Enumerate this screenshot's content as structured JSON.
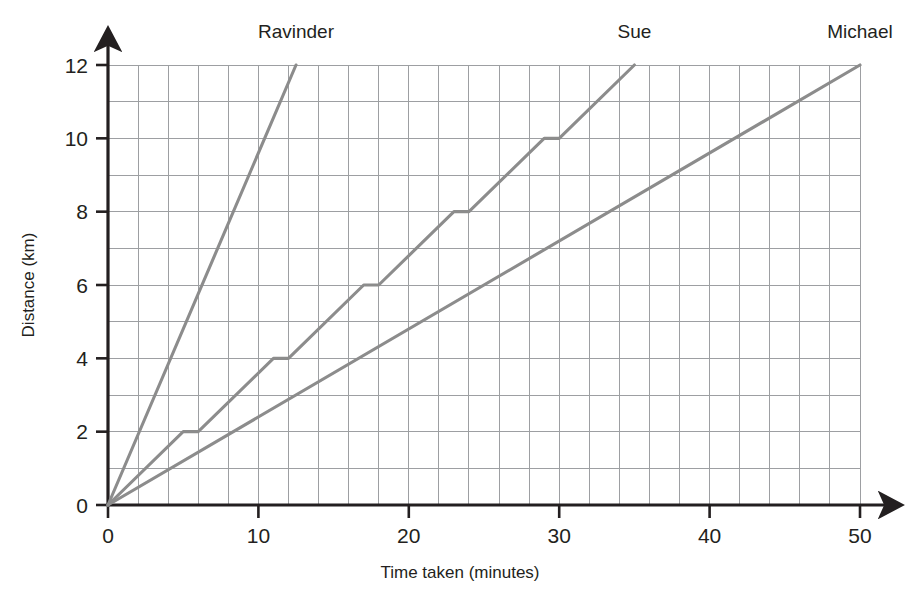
{
  "chart_data": {
    "type": "line",
    "title": "",
    "xlabel": "Time taken (minutes)",
    "ylabel": "Distance (km)",
    "xlim": [
      0,
      50
    ],
    "ylim": [
      0,
      12
    ],
    "xticks": [
      0,
      10,
      20,
      30,
      40,
      50
    ],
    "yticks": [
      0,
      2,
      4,
      6,
      8,
      10,
      12
    ],
    "xtick_labels": [
      "0",
      "10",
      "20",
      "30",
      "40",
      "50"
    ],
    "ytick_labels": [
      "0",
      "2",
      "4",
      "6",
      "8",
      "10",
      "12"
    ],
    "x_minor_step": 2,
    "y_minor_step": 1,
    "grid": true,
    "legend_position": "above-line-ends",
    "line_color": "#8c8c8c",
    "grid_color": "#9d9fa2",
    "axis_color": "#231f20",
    "series": [
      {
        "name": "Ravinder",
        "label": "Ravinder",
        "label_x": 12.5,
        "points": [
          [
            0,
            0
          ],
          [
            12.5,
            12
          ]
        ]
      },
      {
        "name": "Sue",
        "label": "Sue",
        "label_x": 35,
        "points": [
          [
            0,
            0
          ],
          [
            5,
            2
          ],
          [
            6,
            2
          ],
          [
            11,
            4
          ],
          [
            12,
            4
          ],
          [
            17,
            6
          ],
          [
            18,
            6
          ],
          [
            23,
            8
          ],
          [
            24,
            8
          ],
          [
            29,
            10
          ],
          [
            30,
            10
          ],
          [
            35,
            12
          ]
        ]
      },
      {
        "name": "Michael",
        "label": "Michael",
        "label_x": 50,
        "points": [
          [
            0,
            0
          ],
          [
            50,
            12
          ]
        ]
      }
    ]
  },
  "axis_titles": {
    "x": "Time taken (minutes)",
    "y": "Distance (km)"
  }
}
